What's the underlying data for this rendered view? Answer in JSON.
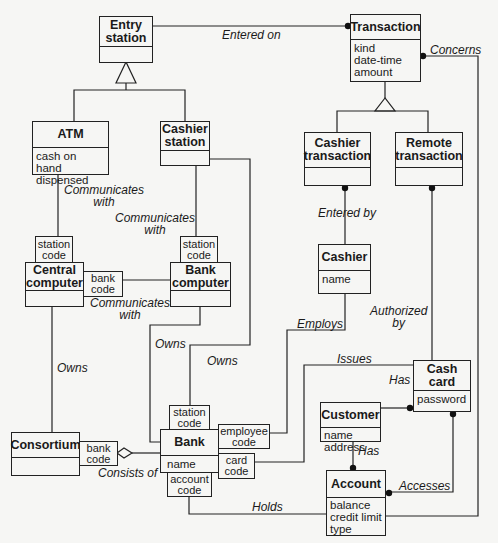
{
  "diagram": {
    "type": "UML class diagram (OMT notation)",
    "classes": {
      "entry_station": {
        "name": "Entry\nstation",
        "attributes": ""
      },
      "transaction": {
        "name": "Transaction",
        "attributes": "kind\ndate-time\namount"
      },
      "atm": {
        "name": "ATM",
        "attributes": "cash on hand\ndispensed"
      },
      "cashier_station": {
        "name": "Cashier\nstation",
        "attributes": ""
      },
      "cashier_transaction": {
        "name": "Cashier\ntransaction",
        "attributes": ""
      },
      "remote_transaction": {
        "name": "Remote\ntransaction",
        "attributes": ""
      },
      "central_computer": {
        "name": "Central\ncomputer",
        "attributes": ""
      },
      "bank_computer": {
        "name": "Bank\ncomputer",
        "attributes": ""
      },
      "cashier": {
        "name": "Cashier",
        "attributes": "name"
      },
      "cash_card": {
        "name": "Cash\ncard",
        "attributes": "password"
      },
      "customer": {
        "name": "Customer",
        "attributes": "name\naddress"
      },
      "consortium": {
        "name": "Consortium",
        "attributes": ""
      },
      "bank": {
        "name": "Bank",
        "attributes": "name"
      },
      "account": {
        "name": "Account",
        "attributes": "balance\ncredit limit\ntype"
      }
    },
    "qualifiers": {
      "central_station_code": "station\ncode",
      "central_bank_code": "bank\ncode",
      "bankcomp_station_code": "station\ncode",
      "consortium_bank_code": "bank\ncode",
      "bank_station_code": "station\ncode",
      "bank_employee_code": "employee\ncode",
      "bank_card_code": "card\ncode",
      "bank_account_code": "account\ncode"
    },
    "associations": {
      "entered_on": "Entered on",
      "concerns": "Concerns",
      "atm_communicates": "Communicates\nwith",
      "cashier_communicates": "Communicates\nwith",
      "central_communicates": "Communicates\nwith",
      "entered_by": "Entered by",
      "authorized_by": "Authorized\nby",
      "employs": "Employs",
      "owns_central": "Owns",
      "owns_bankcomp": "Owns",
      "owns_cashier_station": "Owns",
      "issues": "Issues",
      "has_card": "Has",
      "has_account": "Has",
      "consists_of": "Consists of",
      "accesses": "Accesses",
      "holds": "Holds"
    },
    "colors": {
      "line": "#222222",
      "background": "#f6f6f4"
    }
  }
}
